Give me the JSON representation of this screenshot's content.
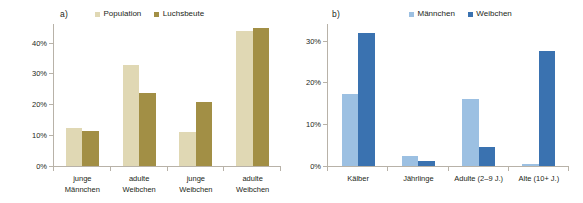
{
  "figure": {
    "background": "#ffffff",
    "width": 583,
    "height": 203
  },
  "panels": [
    {
      "id": "a",
      "label": "a)",
      "legend": [
        {
          "name": "Population",
          "color": "#e0d8b4"
        },
        {
          "name": "Luchsbeute",
          "color": "#a28f45"
        }
      ]
    },
    {
      "id": "b",
      "label": "b)",
      "legend": [
        {
          "name": "Männchen",
          "color": "#9cc0e2"
        },
        {
          "name": "Weibchen",
          "color": "#3a72b0"
        }
      ]
    }
  ],
  "chart_data": [
    {
      "type": "bar",
      "panel": "a)",
      "title": "",
      "xlabel": "",
      "ylabel": "",
      "categories": [
        "junge Männchen",
        "adulte Weibchen",
        "junge Weibchen",
        "adulte Weibchen"
      ],
      "category_lines": [
        [
          "junge",
          "Männchen"
        ],
        [
          "adulte",
          "Weibchen"
        ],
        [
          "junge",
          "Weibchen"
        ],
        [
          "adulte",
          "Weibchen"
        ]
      ],
      "series": [
        {
          "name": "Population",
          "color": "#e0d8b4",
          "values": [
            12.2,
            32.7,
            11.1,
            43.8
          ]
        },
        {
          "name": "Luchsbeute",
          "color": "#a28f45",
          "values": [
            11.3,
            23.8,
            20.6,
            44.7
          ]
        }
      ],
      "ylim": [
        0,
        46
      ],
      "yticks": [
        0,
        10,
        20,
        30,
        40
      ],
      "ytick_labels": [
        "0%",
        "10%",
        "20%",
        "30%",
        "40%"
      ],
      "grid": false,
      "legend_position": "top"
    },
    {
      "type": "bar",
      "panel": "b)",
      "title": "",
      "xlabel": "",
      "ylabel": "",
      "categories": [
        "Kälber",
        "Jährlinge",
        "Adulte (2–9 J.)",
        "Alte (10+ J.)"
      ],
      "category_lines": [
        [
          "Kälber"
        ],
        [
          "Jährlinge"
        ],
        [
          "Adulte (2–9 J.)"
        ],
        [
          "Alte (10+ J.)"
        ]
      ],
      "series": [
        {
          "name": "Männchen",
          "color": "#9cc0e2",
          "values": [
            17.3,
            2.5,
            16.0,
            0.4
          ]
        },
        {
          "name": "Weibchen",
          "color": "#3a72b0",
          "values": [
            31.8,
            1.3,
            4.5,
            27.5
          ]
        }
      ],
      "ylim": [
        0,
        34
      ],
      "yticks": [
        0,
        10,
        20,
        30
      ],
      "ytick_labels": [
        "0%",
        "10%",
        "20%",
        "30%"
      ],
      "grid": false,
      "legend_position": "top"
    }
  ]
}
